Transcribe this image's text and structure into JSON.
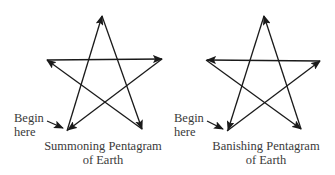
{
  "diagrams": [
    {
      "id": "summoning",
      "begin_label_line1": "Begin",
      "begin_label_line2": "here",
      "caption_line1": "Summoning Pentagram",
      "caption_line2": "of Earth",
      "stroke_order": [
        "bottom-left",
        "top",
        "bottom-right",
        "left",
        "right",
        "bottom-left"
      ]
    },
    {
      "id": "banishing",
      "begin_label_line1": "Begin",
      "begin_label_line2": "here",
      "caption_line1": "Banishing Pentagram",
      "caption_line2": "of Earth",
      "stroke_order": [
        "bottom-left",
        "right",
        "left",
        "bottom-right",
        "top",
        "bottom-left"
      ]
    }
  ],
  "colors": {
    "stroke": "#1a1a1a",
    "text": "#3a3a3a",
    "background": "#ffffff"
  }
}
